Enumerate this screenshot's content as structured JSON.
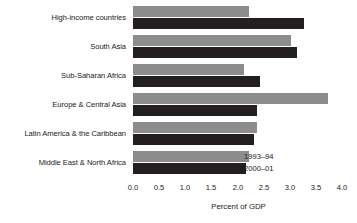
{
  "chart_data": {
    "type": "bar",
    "orientation": "horizontal",
    "title": "",
    "subtitle": "",
    "xlabel": "Percent of GDP",
    "ylabel": "",
    "xlim": [
      0.0,
      4.0
    ],
    "xticks": [
      "0.0",
      "0.5",
      "1.0",
      "1.5",
      "2.0",
      "2.5",
      "3.0",
      "3.5",
      "4.0"
    ],
    "xtick_values": [
      0.0,
      0.5,
      1.0,
      1.5,
      2.0,
      2.5,
      3.0,
      3.5,
      4.0
    ],
    "grid": false,
    "legend_position": "inside-bottom-right",
    "categories": [
      "High-income countries",
      "South Asia",
      "Sub-Saharan Africa",
      "Europe & Central Asia",
      "Latin America & the Caribbean",
      "Middle East & North Africa"
    ],
    "series": [
      {
        "name": "1993–94",
        "color": "#8c8c8c",
        "values": [
          2.2,
          3.0,
          2.1,
          3.7,
          2.35,
          2.2
        ]
      },
      {
        "name": "2000–01",
        "color": "#231f20",
        "values": [
          3.25,
          3.1,
          2.4,
          2.35,
          2.3,
          2.15
        ]
      }
    ]
  },
  "legend": {
    "entries": [
      {
        "label": "1993–94",
        "swatch": "series-old-swatch"
      },
      {
        "label": "2000–01",
        "swatch": "series-new-swatch"
      }
    ]
  }
}
